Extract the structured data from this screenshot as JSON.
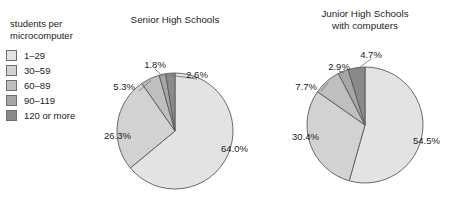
{
  "legend": {
    "title_line1": "students per",
    "title_line2": "microcomputer",
    "items": [
      {
        "label": "1–29",
        "color": "#e3e3e3"
      },
      {
        "label": "30–59",
        "color": "#d2d2d2"
      },
      {
        "label": "60–89",
        "color": "#bfbfbf"
      },
      {
        "label": "90–119",
        "color": "#a6a6a6"
      },
      {
        "label": "120 or more",
        "color": "#8a8a8a"
      }
    ]
  },
  "chart_data": [
    {
      "type": "pie",
      "title": "Senior High Schools",
      "title_lines": [
        "Senior High Schools"
      ],
      "categories": [
        "1–29",
        "30–59",
        "60–89",
        "90–119",
        "120 or more"
      ],
      "values": [
        64.0,
        26.3,
        5.3,
        1.8,
        2.6
      ],
      "labels": [
        "64.0%",
        "26.3%",
        "5.3%",
        "1.8%",
        "2.6%"
      ],
      "colors": [
        "#e3e3e3",
        "#d2d2d2",
        "#bfbfbf",
        "#a6a6a6",
        "#8a8a8a"
      ],
      "start_angle_deg": 0,
      "direction": "clockwise",
      "legend_position": "left-external"
    },
    {
      "type": "pie",
      "title": "Junior High Schools with computers",
      "title_lines": [
        "Junior High Schools",
        "with computers"
      ],
      "categories": [
        "1–29",
        "30–59",
        "60–89",
        "90–119",
        "120 or more"
      ],
      "values": [
        54.5,
        30.4,
        7.7,
        2.9,
        4.7
      ],
      "labels": [
        "54.5%",
        "30.4%",
        "7.7%",
        "2.9%",
        "4.7%"
      ],
      "colors": [
        "#e3e3e3",
        "#d2d2d2",
        "#bfbfbf",
        "#a6a6a6",
        "#8a8a8a"
      ],
      "start_angle_deg": 0,
      "direction": "clockwise",
      "legend_position": "left-external"
    }
  ]
}
